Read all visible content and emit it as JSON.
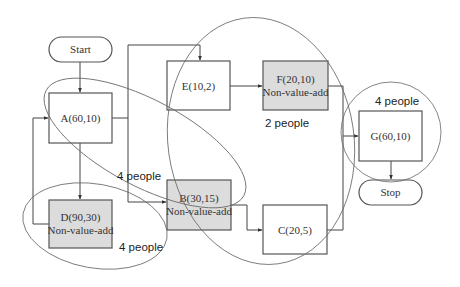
{
  "diagram": {
    "type": "process-flowchart",
    "colors": {
      "value_add_fill": "#ffffff",
      "non_value_add_fill": "#dcdcdc",
      "stroke": "#555555"
    },
    "terminals": {
      "start": {
        "label": "Start"
      },
      "stop": {
        "label": "Stop"
      }
    },
    "nodes": {
      "A": {
        "line1": "A(60,10)",
        "line2": ""
      },
      "B": {
        "line1": "B(30,15)",
        "line2": "Non-value-add"
      },
      "C": {
        "line1": "C(20,5)",
        "line2": ""
      },
      "D": {
        "line1": "D(90,30)",
        "line2": "Non-value-add"
      },
      "E": {
        "line1": "E(10,2)",
        "line2": ""
      },
      "F": {
        "line1": "F(20,10)",
        "line2": "Non-value-add"
      },
      "G": {
        "line1": "G(60,10)",
        "line2": ""
      }
    },
    "edges": [
      {
        "from": "Start",
        "to": "A"
      },
      {
        "from": "A",
        "to": "E"
      },
      {
        "from": "A",
        "to": "B"
      },
      {
        "from": "A",
        "to": "D"
      },
      {
        "from": "D",
        "to": "A"
      },
      {
        "from": "E",
        "to": "F"
      },
      {
        "from": "B",
        "to": "C"
      },
      {
        "from": "F",
        "to": "G"
      },
      {
        "from": "C",
        "to": "G"
      },
      {
        "from": "G",
        "to": "Stop"
      }
    ],
    "groups": [
      {
        "id": "group-ab",
        "label": "4 people"
      },
      {
        "id": "group-efc",
        "label": "2 people"
      },
      {
        "id": "group-g",
        "label": "4 people"
      },
      {
        "id": "group-d",
        "label": "4 people"
      }
    ]
  }
}
